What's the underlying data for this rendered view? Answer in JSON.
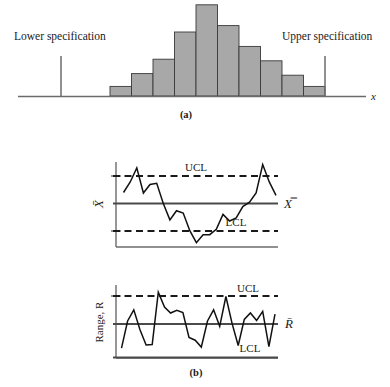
{
  "figure": {
    "panel_a": {
      "caption": "(a)",
      "lower_spec_label": "Lower specification",
      "upper_spec_label": "Upper specification",
      "x_axis_label": "x",
      "lower_spec_x": 61,
      "upper_spec_x": 325,
      "baseline_y": 96,
      "bar_fill": "#a8a8a8",
      "bar_stroke": "#3a3a3a"
    },
    "panel_b": {
      "caption": "(b)",
      "xbar_chart": {
        "left_label": "X̄",
        "right_label": "X̿",
        "ucl_label": "UCL",
        "lcl_label": "LCL"
      },
      "r_chart": {
        "left_label": "Range, R",
        "right_label": "R̄",
        "ucl_label": "UCL",
        "lcl_label": "LCL"
      }
    }
  },
  "chart_data": [
    {
      "type": "bar",
      "title": "(a) Process distribution relative to specifications",
      "xlabel": "x",
      "ylabel": "",
      "annotations": [
        "Lower specification",
        "Upper specification"
      ],
      "grid": false,
      "legend_position": "none",
      "categories": [
        "b1",
        "b2",
        "b3",
        "b4",
        "b5",
        "b6",
        "b7",
        "b8",
        "b9",
        "b10"
      ],
      "values": [
        6,
        14,
        23,
        40,
        57,
        44,
        31,
        22,
        13,
        6
      ],
      "ylim": [
        0,
        60
      ],
      "bar_left_x": 110,
      "bar_width": 21.5,
      "baseline_y": 96,
      "lower_spec_x": 61,
      "upper_spec_x": 325,
      "spec_top_y": 56
    },
    {
      "type": "line",
      "title": "(b) X-bar control chart",
      "xlabel": "",
      "ylabel": "X̄",
      "grid": false,
      "legend_position": "none",
      "center_line": 0,
      "ucl": 1.0,
      "lcl": -1.0,
      "ylim": [
        -1.55,
        1.55
      ],
      "annotations": [
        "UCL",
        "LCL",
        "X̿"
      ],
      "x": [
        0,
        1,
        2,
        3,
        4,
        5,
        6,
        7,
        8,
        9,
        10,
        11,
        12,
        13,
        14,
        15,
        16,
        17,
        18,
        19,
        20,
        21,
        22,
        23
      ],
      "values": [
        0.44,
        0.8,
        1.3,
        0.42,
        0.72,
        0.76,
        0.05,
        -0.52,
        -0.2,
        -0.28,
        -0.9,
        -1.32,
        -1.04,
        -1.04,
        -0.85,
        -0.33,
        -0.56,
        -0.45,
        -0.05,
        0.1,
        0.42,
        1.42,
        0.8,
        0.34
      ]
    },
    {
      "type": "line",
      "title": "(b) R control chart",
      "xlabel": "",
      "ylabel": "Range, R",
      "grid": false,
      "legend_position": "none",
      "center_line": 0,
      "ucl": 0.72,
      "lcl": -1.0,
      "ylim": [
        -1.15,
        1.25
      ],
      "annotations": [
        "UCL",
        "LCL",
        "R̄"
      ],
      "x": [
        0,
        1,
        2,
        3,
        4,
        5,
        6,
        7,
        8,
        9,
        10,
        11,
        12,
        13,
        14,
        15,
        16,
        17,
        18,
        19,
        20,
        21,
        22,
        23,
        24,
        25
      ],
      "values": [
        -0.92,
        0.1,
        0.52,
        -0.22,
        -0.8,
        -0.78,
        1.18,
        0.62,
        0.4,
        0.5,
        0.42,
        -0.52,
        -0.62,
        -0.88,
        0.1,
        0.52,
        -0.1,
        1.02,
        0.02,
        -0.82,
        0.16,
        0.4,
        0.12,
        0.46,
        -0.86,
        0.36
      ]
    }
  ]
}
